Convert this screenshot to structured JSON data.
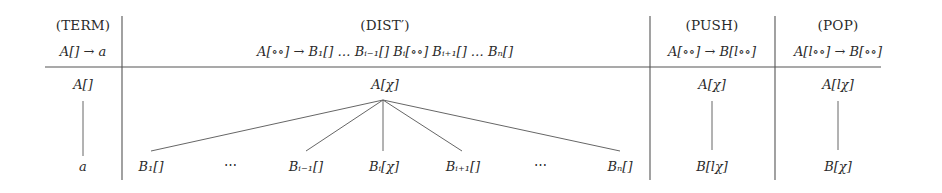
{
  "diagram": {
    "columns": [
      {
        "id": "term",
        "header": "(TERM)",
        "rule": "A[] → a",
        "tree": {
          "root": "A[]",
          "children": [
            "a"
          ]
        }
      },
      {
        "id": "dist",
        "header": "(DIST′)",
        "rule": "A[∘∘] → B₁[] … Bᵢ₋₁[] Bᵢ[∘∘] Bᵢ₊₁[] … Bₙ[]",
        "tree": {
          "root": "A[χ]",
          "children": [
            "B₁[]",
            "⋯",
            "Bᵢ₋₁[]",
            "Bᵢ[χ]",
            "Bᵢ₊₁[]",
            "⋯",
            "Bₙ[]"
          ]
        }
      },
      {
        "id": "push",
        "header": "(PUSH)",
        "rule": "A[∘∘] → B[l∘∘]",
        "tree": {
          "root": "A[χ]",
          "children": [
            "B[lχ]"
          ]
        }
      },
      {
        "id": "pop",
        "header": "(POP)",
        "rule": "A[l∘∘] → B[∘∘]",
        "tree": {
          "root": "A[lχ]",
          "children": [
            "B[χ]"
          ]
        }
      }
    ],
    "colors": {
      "ink": "#2a2a2a",
      "rule": "#555555",
      "edge": "#666666",
      "background": "#ffffff"
    }
  }
}
